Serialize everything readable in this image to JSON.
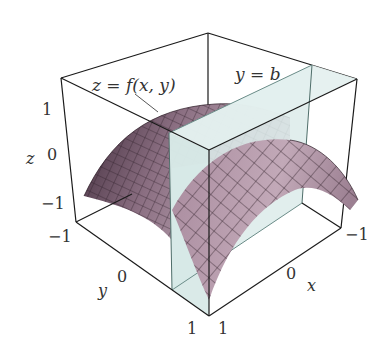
{
  "figure": {
    "type": "3d-surface-plot-with-vertical-plane",
    "surface_label": "z = f(x, y)",
    "plane_label": "y = b",
    "axes": {
      "x": {
        "label": "x",
        "ticks": [
          "-1",
          "0",
          "1"
        ]
      },
      "y": {
        "label": "y",
        "ticks": [
          "-1",
          "0",
          "1"
        ]
      },
      "z": {
        "label": "z",
        "ticks": [
          "1",
          "0",
          "-1"
        ]
      }
    },
    "colors": {
      "surface": "#b79aab",
      "surface_dark": "#5a4052",
      "plane": "#dcebea",
      "plane_edge": "#6a8c88",
      "box": "#1a1a1a",
      "text": "#333333"
    }
  }
}
